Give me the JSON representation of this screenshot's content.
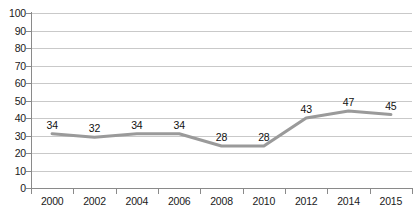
{
  "chart_data": {
    "type": "line",
    "title": "",
    "subtitle": "",
    "xlabel": "",
    "ylabel": "",
    "categories": [
      "2000",
      "2002",
      "2004",
      "2006",
      "2008",
      "2010",
      "2012",
      "2014",
      "2015"
    ],
    "values": [
      34,
      32,
      34,
      34,
      28,
      28,
      43,
      47,
      45
    ],
    "series": [
      {
        "name": "",
        "values": [
          34,
          32,
          34,
          34,
          28,
          28,
          43,
          47,
          45
        ]
      }
    ],
    "data_labels": [
      "34",
      "32",
      "34",
      "34",
      "28",
      "28",
      "43",
      "47",
      "45"
    ],
    "ylim": [
      0,
      100
    ],
    "ytick_step": 10,
    "yticks": [
      0,
      10,
      20,
      30,
      40,
      50,
      60,
      70,
      80,
      90,
      100
    ],
    "ytick_labels": [
      "0",
      "10",
      "20",
      "30",
      "40",
      "50",
      "60",
      "70",
      "80",
      "90",
      "100"
    ],
    "grid": true,
    "grid_axis": "y",
    "legend": false,
    "legend_position": "none",
    "markers": false,
    "colors": {
      "line": "#9a9a9a",
      "gridline": "#c9c9c9",
      "axis": "#8a8a8a",
      "text": "#111111",
      "background": "#ffffff"
    },
    "line_width": 3.2,
    "plot_values": [
      31,
      29,
      31,
      31,
      24,
      24,
      40,
      44,
      42
    ]
  }
}
